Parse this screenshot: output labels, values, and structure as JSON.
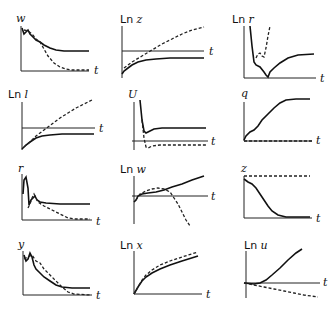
{
  "figure": {
    "x_axis_label": "t",
    "legend": {
      "solid": "series A (solid line)",
      "dashed": "series B (dashed line)"
    },
    "panels": [
      {
        "id": "w",
        "prefix": "",
        "var": "w",
        "row": 1,
        "col": 1
      },
      {
        "id": "lnz",
        "prefix": "Ln",
        "var": "z",
        "row": 1,
        "col": 2
      },
      {
        "id": "lnr",
        "prefix": "Ln",
        "var": "r",
        "row": 1,
        "col": 3
      },
      {
        "id": "lnl",
        "prefix": "Ln",
        "var": "l",
        "row": 2,
        "col": 1
      },
      {
        "id": "U",
        "prefix": "",
        "var": "U",
        "row": 2,
        "col": 2
      },
      {
        "id": "q",
        "prefix": "",
        "var": "q",
        "row": 2,
        "col": 3
      },
      {
        "id": "r",
        "prefix": "",
        "var": "r",
        "row": 3,
        "col": 1
      },
      {
        "id": "lnw",
        "prefix": "Ln",
        "var": "w",
        "row": 3,
        "col": 2
      },
      {
        "id": "z",
        "prefix": "",
        "var": "z",
        "row": 3,
        "col": 3
      },
      {
        "id": "y",
        "prefix": "",
        "var": "y",
        "row": 4,
        "col": 1
      },
      {
        "id": "lnx",
        "prefix": "Ln",
        "var": "x",
        "row": 4,
        "col": 2
      },
      {
        "id": "lnu",
        "prefix": "Ln",
        "var": "u",
        "row": 4,
        "col": 3
      }
    ]
  }
}
